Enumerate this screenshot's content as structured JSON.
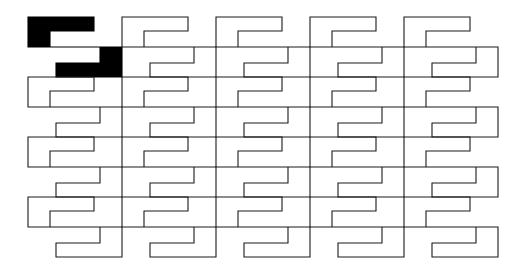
{
  "figure": {
    "description": "A plane tessellation built from a single S/E-shaped interlocking tile repeated in a 5 column by 4 row grid. The tile in the top-left position is filled solid black to highlight the prototile; all other tiles are drawn as thin black outlines on a white background.",
    "background_color": "#ffffff",
    "outline_color": "#1a1a1a",
    "fill_color": "#000000",
    "stroke_width": 1.1
  },
  "canvas": {
    "width": 528,
    "height": 268
  },
  "grid": {
    "columns": 5,
    "rows": 4,
    "origin_x": 28,
    "origin_y": 17,
    "cell_width": 94,
    "cell_height": 60,
    "highlighted_tile": {
      "column": 0,
      "row": 0
    }
  },
  "tile": {
    "name": "s-shaped-interlocking-prototile",
    "unit_width": 94,
    "unit_height": 60,
    "notch_depth": 30,
    "arm_thickness": 14,
    "outline_points": "0,0 66,0 66,14 22,14 22,30 94,30 94,60 28,60 28,46 72,46 72,30 0,30",
    "comment": "Polygon coordinates in tile-local units; tiles tile the plane by translation with period (94,60)."
  },
  "tiles": [
    {
      "id": "tile-r0-c0",
      "row": 0,
      "column": 0,
      "x": 28,
      "y": 17,
      "filled": true
    },
    {
      "id": "tile-r0-c1",
      "row": 0,
      "column": 1,
      "x": 122,
      "y": 17,
      "filled": false
    },
    {
      "id": "tile-r0-c2",
      "row": 0,
      "column": 2,
      "x": 216,
      "y": 17,
      "filled": false
    },
    {
      "id": "tile-r0-c3",
      "row": 0,
      "column": 3,
      "x": 310,
      "y": 17,
      "filled": false
    },
    {
      "id": "tile-r0-c4",
      "row": 0,
      "column": 4,
      "x": 404,
      "y": 17,
      "filled": false
    },
    {
      "id": "tile-r1-c0",
      "row": 1,
      "column": 0,
      "x": 28,
      "y": 77,
      "filled": false
    },
    {
      "id": "tile-r1-c1",
      "row": 1,
      "column": 1,
      "x": 122,
      "y": 77,
      "filled": false
    },
    {
      "id": "tile-r1-c2",
      "row": 1,
      "column": 2,
      "x": 216,
      "y": 77,
      "filled": false
    },
    {
      "id": "tile-r1-c3",
      "row": 1,
      "column": 3,
      "x": 310,
      "y": 77,
      "filled": false
    },
    {
      "id": "tile-r1-c4",
      "row": 1,
      "column": 4,
      "x": 404,
      "y": 77,
      "filled": false
    },
    {
      "id": "tile-r2-c0",
      "row": 2,
      "column": 0,
      "x": 28,
      "y": 137,
      "filled": false
    },
    {
      "id": "tile-r2-c1",
      "row": 2,
      "column": 1,
      "x": 122,
      "y": 137,
      "filled": false
    },
    {
      "id": "tile-r2-c2",
      "row": 2,
      "column": 2,
      "x": 216,
      "y": 137,
      "filled": false
    },
    {
      "id": "tile-r2-c3",
      "row": 2,
      "column": 3,
      "x": 310,
      "y": 137,
      "filled": false
    },
    {
      "id": "tile-r2-c4",
      "row": 2,
      "column": 4,
      "x": 404,
      "y": 137,
      "filled": false
    },
    {
      "id": "tile-r3-c0",
      "row": 3,
      "column": 0,
      "x": 28,
      "y": 197,
      "filled": false
    },
    {
      "id": "tile-r3-c1",
      "row": 3,
      "column": 1,
      "x": 122,
      "y": 197,
      "filled": false
    },
    {
      "id": "tile-r3-c2",
      "row": 3,
      "column": 2,
      "x": 216,
      "y": 197,
      "filled": false
    },
    {
      "id": "tile-r3-c3",
      "row": 3,
      "column": 3,
      "x": 310,
      "y": 197,
      "filled": false
    },
    {
      "id": "tile-r3-c4",
      "row": 3,
      "column": 4,
      "x": 404,
      "y": 197,
      "filled": false
    }
  ]
}
